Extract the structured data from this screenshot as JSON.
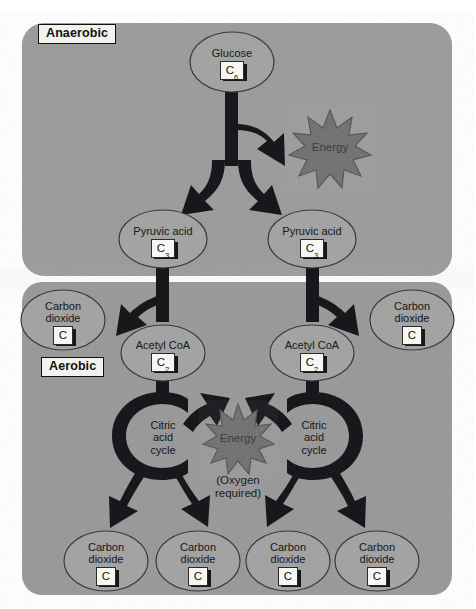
{
  "figure": {
    "background_color": "#ffffff"
  },
  "colors": {
    "panel": "#9a9a9a",
    "panel_aerobic": "#979797",
    "oval_fill": "#a3a3a3",
    "oval_stroke": "#3a3a3a",
    "arrow": "#16181c",
    "burst_fill": "#6e6e6e",
    "burst_stroke": "#4a4a4a",
    "label_box_fill": "#f2f2ee",
    "label_box_border": "#111111",
    "text": "#1a1a1a"
  },
  "panels": [
    {
      "id": "anaerobic",
      "label": "Anaerobic"
    },
    {
      "id": "aerobic",
      "label": "Aerobic"
    }
  ],
  "nodes": [
    {
      "id": "glucose",
      "name": "Glucose",
      "formula": "C",
      "subscript": "6"
    },
    {
      "id": "pyruvate-l",
      "name": "Pyruvic acid",
      "formula": "C",
      "subscript": "3"
    },
    {
      "id": "pyruvate-r",
      "name": "Pyruvic acid",
      "formula": "C",
      "subscript": "3"
    },
    {
      "id": "co2-upper-l",
      "name": "Carbon\ndioxide",
      "formula": "C",
      "subscript": ""
    },
    {
      "id": "co2-upper-r",
      "name": "Carbon\ndioxide",
      "formula": "C",
      "subscript": ""
    },
    {
      "id": "acetylcoa-l",
      "name": "Acetyl CoA",
      "formula": "C",
      "subscript": "2"
    },
    {
      "id": "acetylcoa-r",
      "name": "Acetyl CoA",
      "formula": "C",
      "subscript": "2"
    },
    {
      "id": "co2-b1",
      "name": "Carbon\ndioxide",
      "formula": "C",
      "subscript": ""
    },
    {
      "id": "co2-b2",
      "name": "Carbon\ndioxide",
      "formula": "C",
      "subscript": ""
    },
    {
      "id": "co2-b3",
      "name": "Carbon\ndioxide",
      "formula": "C",
      "subscript": ""
    },
    {
      "id": "co2-b4",
      "name": "Carbon\ndioxide",
      "formula": "C",
      "subscript": ""
    }
  ],
  "cycles": [
    {
      "id": "citric-left",
      "label": "Citric\nacid\ncycle"
    },
    {
      "id": "citric-right",
      "label": "Citric\nacid\ncycle"
    }
  ],
  "energy": [
    {
      "id": "energy-glycolysis",
      "label": "Energy"
    },
    {
      "id": "energy-citric",
      "label": "Energy"
    }
  ],
  "notes": [
    {
      "id": "oxygen-note",
      "label": "(Oxygen\nrequired)"
    }
  ]
}
